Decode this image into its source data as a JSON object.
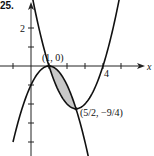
{
  "problem_number": "25.",
  "chart_data": {
    "type": "line",
    "title": "",
    "xlabel": "x",
    "ylabel": "",
    "xlim": [
      -1,
      6
    ],
    "ylim": [
      -4.5,
      3.5
    ],
    "grid": false,
    "xticks": [
      -1,
      1,
      2,
      3,
      4,
      5
    ],
    "yticks": [
      -4,
      -3,
      -2,
      -1,
      1,
      2
    ],
    "x_tick_labels": [
      {
        "value": 4,
        "text": "4"
      }
    ],
    "y_tick_labels": [
      {
        "value": 2,
        "text": "2"
      }
    ],
    "series": [
      {
        "name": "f(x) = x^2 - 5x + 4",
        "coefficients": [
          1,
          -5,
          4
        ],
        "x_range": [
          -0.2,
          5.1
        ]
      },
      {
        "name": "g(x) = -(x - 1)^2",
        "coefficients": [
          -1,
          2,
          -1
        ],
        "x_range": [
          -1.0,
          3.4
        ]
      }
    ],
    "shaded_region": {
      "between": [
        "f(x) = x^2 - 5x + 4",
        "g(x) = -(x - 1)^2"
      ],
      "x_from": 1,
      "x_to": 2.5,
      "color": "#c8c8c8"
    },
    "annotations": [
      {
        "text": "(1, 0)",
        "x": 1,
        "y": 0
      },
      {
        "text": "(5/2, −9/4)",
        "x": 2.5,
        "y": -2.25
      }
    ]
  }
}
